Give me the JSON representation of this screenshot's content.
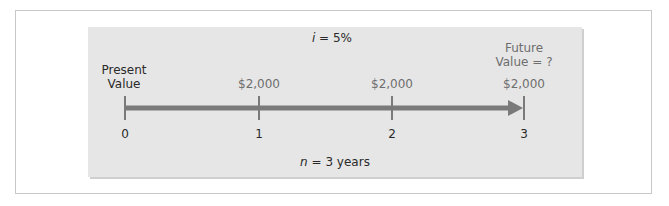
{
  "diagram": {
    "title_rate": {
      "var": "i",
      "rest": " = 5%"
    },
    "period": {
      "var": "n",
      "rest": " = 3 years"
    },
    "present_value_label": [
      "Present",
      "Value"
    ],
    "future_value_label": [
      "Future",
      "Value = ?"
    ],
    "ticks": [
      {
        "label": "0",
        "payment": ""
      },
      {
        "label": "1",
        "payment": "$2,000"
      },
      {
        "label": "2",
        "payment": "$2,000"
      },
      {
        "label": "3",
        "payment": "$2,000"
      }
    ],
    "colors": {
      "panel": "#e6e6e6",
      "axis": "#7a7a7a",
      "dark_text": "#2a2a2a",
      "muted_text": "#6e6e6e",
      "border": "#c9c9c9"
    }
  }
}
